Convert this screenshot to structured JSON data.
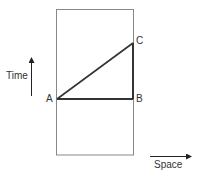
{
  "diagram": {
    "type": "spacetime-diagram",
    "axes": {
      "time_label": "Time",
      "space_label": "Space"
    },
    "points": {
      "A": "A",
      "B": "B",
      "C": "C"
    },
    "segments": [
      {
        "from": "A",
        "to": "B"
      },
      {
        "from": "B",
        "to": "C"
      },
      {
        "from": "A",
        "to": "C"
      }
    ],
    "colors": {
      "frame": "#888888",
      "triangle": "#333333",
      "arrow": "#222222",
      "text": "#333333"
    }
  }
}
